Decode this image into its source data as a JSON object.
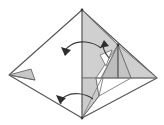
{
  "figure": {
    "type": "origami-diagram",
    "width": 164,
    "height": 125,
    "background_color": "#ffffff",
    "caption": ""
  },
  "style": {
    "outline_color": "#555555",
    "crease_color": "#777777",
    "shade_light": "#d9d9d9",
    "shade_mid": "#c7c7c7",
    "shade_dark": "#b5b5b5",
    "paper_white": "#ffffff",
    "arrow_color": "#3a3a3a",
    "outline_width": 1.1,
    "crease_width": 0.8
  },
  "geometry": {
    "vertices": {
      "top": [
        82,
        10
      ],
      "bottom": [
        82,
        118
      ],
      "left": [
        9,
        75
      ],
      "right": [
        157,
        78
      ],
      "mid_peak": [
        118,
        45
      ],
      "mid_right": [
        131,
        78
      ],
      "inner_left": [
        96,
        78
      ],
      "low_notch": [
        99,
        96
      ],
      "left_small_tip": [
        30,
        70
      ]
    },
    "center_crease": {
      "from": [
        82,
        10
      ],
      "to": [
        82,
        118
      ],
      "label": "vertical center crease"
    },
    "peak_crease": {
      "from": [
        118,
        45
      ],
      "to": [
        118,
        78
      ],
      "label": "secondary vertical crease"
    }
  },
  "shapes": [
    {
      "name": "outer-diamond",
      "role": "paper-outline",
      "points": "82,10 157,78 82,118 9,75",
      "fill": "#ffffff",
      "stroke": "#555555"
    },
    {
      "name": "left-small-triangle",
      "role": "shaded-flap",
      "points": "9,75 30,70 34,80",
      "fill": "#c7c7c7",
      "stroke": "#666666"
    },
    {
      "name": "upper-right-shaded-flap",
      "role": "shaded-flap",
      "points": "82,10 118,45 96,78 82,78",
      "fill": "#d0d0d0",
      "stroke": "#6a6a6a"
    },
    {
      "name": "lower-center-shaded-flap",
      "role": "shaded-flap",
      "points": "82,78 96,78 99,96 82,118",
      "fill": "#cccccc",
      "stroke": "#6a6a6a"
    },
    {
      "name": "right-wing-shaded",
      "role": "shaded-flap",
      "points": "118,45 157,78 131,78",
      "fill": "#cfcfcf",
      "stroke": "#6a6a6a"
    },
    {
      "name": "peak-left-shaded",
      "role": "shaded-flap",
      "points": "118,45 118,78 103,78",
      "fill": "#bdbdbd",
      "stroke": "#6a6a6a"
    },
    {
      "name": "peak-right-shaded",
      "role": "shaded-flap",
      "points": "118,45 131,78 118,78",
      "fill": "#c4c4c4",
      "stroke": "#6a6a6a"
    },
    {
      "name": "white-notch-triangle",
      "role": "white-facet",
      "points": "96,78 103,78 99,96",
      "fill": "#ffffff",
      "stroke": "#6a6a6a"
    },
    {
      "name": "white-wedge-upper",
      "role": "white-facet",
      "points": "100,55 112,50 106,66",
      "fill": "#ffffff",
      "stroke": "#6a6a6a"
    }
  ],
  "arrows": [
    {
      "name": "arrow-upper-left",
      "label": "fold flap over (upper)",
      "path": "M 101 48 C 92 41 79 40 71 45 C 66 48 64 52 65 55",
      "head_at": [
        65,
        55
      ],
      "head_angle": 150,
      "style": "curved-rotation"
    },
    {
      "name": "arrow-lower-left",
      "label": "fold flap over (lower)",
      "path": "M 93 99 C 85 93 73 92 66 96 C 62 98 60 101 61 104",
      "head_at": [
        61,
        104
      ],
      "head_angle": 150,
      "style": "curved-rotation"
    },
    {
      "name": "arrow-center-small",
      "label": "fold small flap (center)",
      "path": "M 109 58 C 104 52 102 46 104 42",
      "head_at": [
        104,
        42
      ],
      "head_angle": -75,
      "style": "curved-rotation-small"
    }
  ],
  "creases": [
    {
      "name": "center-crease",
      "from": [
        82,
        10
      ],
      "to": [
        82,
        118
      ]
    },
    {
      "name": "peak-crease",
      "from": [
        118,
        45
      ],
      "to": [
        118,
        78
      ]
    },
    {
      "name": "horizontal-right-edge",
      "from": [
        96,
        78
      ],
      "to": [
        157,
        78
      ]
    },
    {
      "name": "top-to-peak",
      "from": [
        82,
        10
      ],
      "to": [
        118,
        45
      ]
    },
    {
      "name": "peak-to-bottom",
      "from": [
        118,
        45
      ],
      "to": [
        82,
        118
      ]
    },
    {
      "name": "notch-to-bottom",
      "from": [
        99,
        96
      ],
      "to": [
        82,
        118
      ]
    },
    {
      "name": "notch-to-right",
      "from": [
        99,
        96
      ],
      "to": [
        131,
        78
      ]
    }
  ]
}
